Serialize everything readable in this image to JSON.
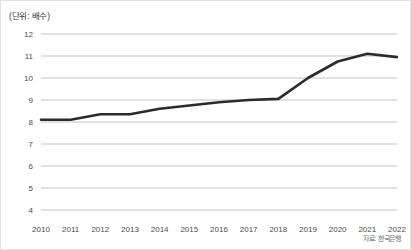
{
  "chart_data": {
    "type": "line",
    "title": "",
    "unit_label": "(단위: 배수)",
    "source_note": "자료: 한국은행",
    "xlabel": "",
    "ylabel": "",
    "categories": [
      "2010",
      "2011",
      "2012",
      "2013",
      "2014",
      "2015",
      "2016",
      "2017",
      "2018",
      "2019",
      "2020",
      "2021",
      "2022"
    ],
    "values": [
      8.1,
      8.1,
      8.35,
      8.35,
      8.6,
      8.75,
      8.9,
      9.0,
      9.05,
      10.0,
      10.75,
      11.1,
      10.95
    ],
    "ylim": [
      4,
      12
    ],
    "yticks": [
      12,
      11,
      10,
      9,
      8,
      7,
      6,
      5,
      4
    ],
    "xticks": [
      "2010",
      "2011",
      "2012",
      "2013",
      "2014",
      "2015",
      "2016",
      "2017",
      "2018",
      "2019",
      "2020",
      "2021",
      "2022"
    ],
    "grid": true,
    "legend": "none",
    "series": [
      {
        "name": "",
        "color": "#2b2b2b",
        "values": [
          8.1,
          8.1,
          8.35,
          8.35,
          8.6,
          8.75,
          8.9,
          9.0,
          9.05,
          10.0,
          10.75,
          11.1,
          10.95
        ]
      }
    ],
    "colors": {
      "line": "#2b2b2b",
      "grid": "#b4b4b4",
      "tick_text": "#4a4a4a",
      "unit_text": "#333333",
      "source_text": "#6c6c6c",
      "background": "#ffffff",
      "border": "#e2e2e2"
    }
  }
}
